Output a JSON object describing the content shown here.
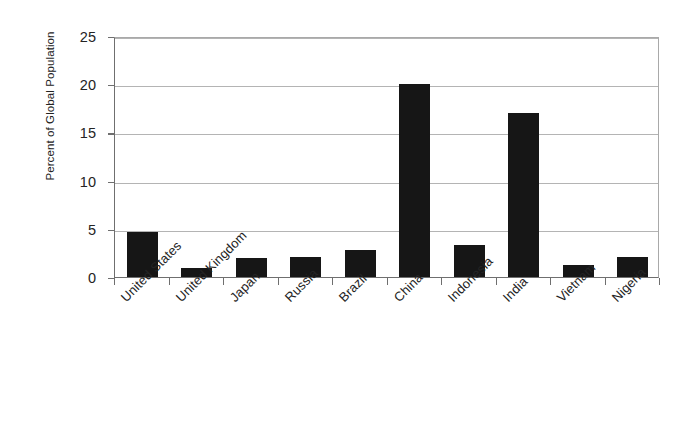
{
  "chart_data": {
    "type": "bar",
    "title": "",
    "xlabel": "",
    "ylabel": "Percent of Global Population",
    "ylim": [
      0,
      25
    ],
    "yticks": [
      0,
      5,
      10,
      15,
      20,
      25
    ],
    "ytick_labels": [
      "0",
      "5",
      "10",
      "15",
      "20",
      "25"
    ],
    "grid": true,
    "legend": false,
    "xtick_rotation": -45,
    "categories": [
      "United States",
      "United Kingdom",
      "Japan",
      "Russia",
      "Brazil",
      "China",
      "Indonesia",
      "India",
      "Vietnam",
      "Nigeria"
    ],
    "values": [
      4.7,
      0.9,
      2.0,
      2.1,
      2.8,
      20.0,
      3.3,
      17.0,
      1.2,
      2.1
    ],
    "bar_color": "#161616",
    "axis_color": "#6f6f6f",
    "grid_color": "#b4b4b4",
    "background_color": "#ffffff"
  }
}
